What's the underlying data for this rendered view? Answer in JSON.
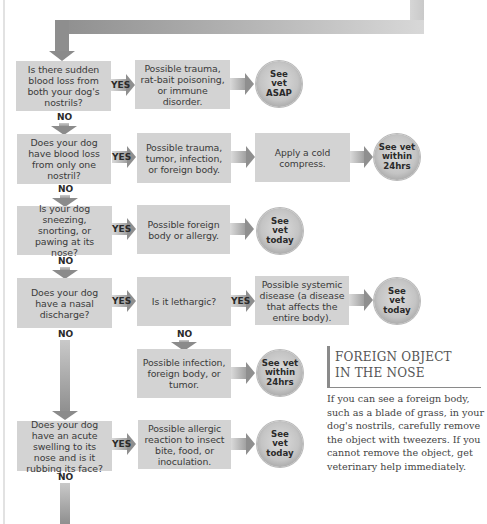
{
  "flowchart": {
    "rows": [
      {
        "question": "Is there sudden blood loss from both your dog's nostrils?",
        "yes_label": "YES",
        "no_label": "NO",
        "cause": "Possible trauma, rat-bait poisoning, or immune disorder.",
        "outcome": "See vet ASAP"
      },
      {
        "question": "Does your dog have blood loss from only one nostril?",
        "yes_label": "YES",
        "no_label": "NO",
        "cause": "Possible trauma, tumor, infection, or foreign body.",
        "action": "Apply a cold compress.",
        "outcome": "See vet within 24hrs"
      },
      {
        "question": "Is your dog sneezing, snorting, or pawing at its nose?",
        "yes_label": "YES",
        "no_label": "NO",
        "cause": "Possible foreign body or allergy.",
        "outcome": "See vet today"
      },
      {
        "question": "Does your dog have a nasal discharge?",
        "yes_label": "YES",
        "no_label": "NO",
        "sub_question": "Is it lethargic?",
        "sub_yes_label": "YES",
        "sub_no_label": "NO",
        "sub_yes_cause": "Possible systemic disease (a disease that affects the entire body).",
        "sub_yes_outcome": "See vet today",
        "sub_no_cause": "Possible infection, foreign body, or tumor.",
        "sub_no_outcome": "See vet within 24hrs"
      },
      {
        "question": "Does your dog have an acute swelling to its nose and is it rubbing its face?",
        "yes_label": "YES",
        "no_label": "NO",
        "cause": "Possible allergic reaction to insect bite, food, or inoculation.",
        "outcome": "See vet today"
      }
    ]
  },
  "sidebar": {
    "title_line1": "FOREIGN OBJECT",
    "title_line2": "IN THE NOSE",
    "body": "If you can see a foreign body, such as a blade of grass, in your dog's nostrils, carefully remove the object with tweezers. If you cannot remove the object, get veterinary help immediately."
  },
  "colors": {
    "box_fill": "#d3d3d3",
    "arrow_dark": "#8f8f8f",
    "arrow_light": "#dadada",
    "text": "#3a3a3a"
  }
}
